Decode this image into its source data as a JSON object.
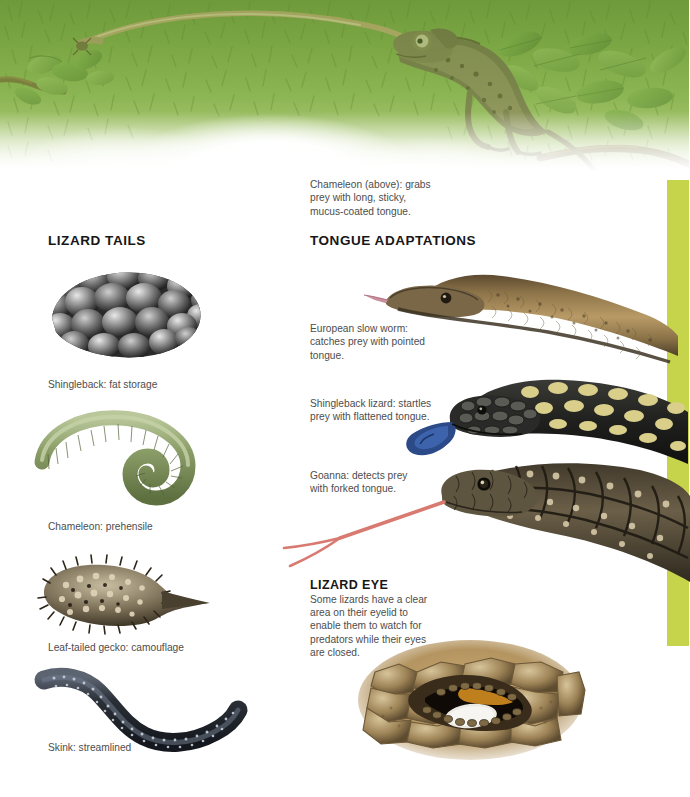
{
  "page": {
    "accent_bar_color": "#c5d44a",
    "background_color": "#ffffff",
    "text_color": "#4d4d4d",
    "heading_color": "#161616"
  },
  "banner": {
    "name": "chameleon-banner",
    "subject": "chameleon-catching-prey-with-tongue",
    "foliage_color": "#7aa442"
  },
  "callouts": {
    "chameleon": "Chameleon (above): grabs prey with long, sticky, mucus-coated tongue.",
    "slow_worm": "European slow worm: catches prey with pointed tongue.",
    "shingleback": "Shingleback lizard: startles prey with flattened tongue.",
    "goanna": "Goanna: detects prey with forked tongue."
  },
  "sections": {
    "lizard_tails": {
      "heading": "LIZARD TAILS",
      "items": [
        {
          "caption": "Shingleback: fat storage",
          "figure": "shingleback-tail-figure"
        },
        {
          "caption": "Chameleon: prehensile",
          "figure": "chameleon-tail-figure"
        },
        {
          "caption": "Leaf-tailed gecko: camouflage",
          "figure": "leaf-tailed-gecko-tail-figure"
        },
        {
          "caption": "Skink: streamlined",
          "figure": "skink-tail-figure"
        }
      ]
    },
    "tongue_adaptations": {
      "heading": "TONGUE ADAPTATIONS",
      "figures": [
        "european-slow-worm-figure",
        "shingleback-lizard-figure",
        "goanna-figure"
      ]
    },
    "lizard_eye": {
      "heading": "LIZARD EYE",
      "body": "Some lizards have a clear area on their eyelid to enable them to watch for predators while their eyes are closed.",
      "figure": "lizard-eye-figure"
    }
  }
}
